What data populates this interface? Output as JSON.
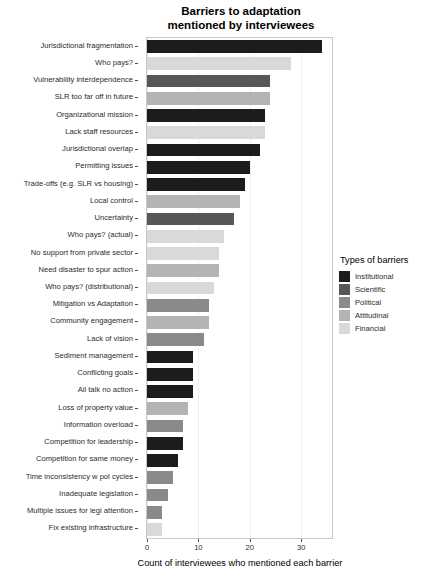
{
  "chart_data": {
    "type": "bar",
    "orientation": "horizontal",
    "title": "Barriers to adaptation\nmentioned by interviewees",
    "xlabel": "Count of interviewees who mentioned each barrier",
    "ylabel": "",
    "xlim": [
      0,
      36
    ],
    "xticks": [
      0,
      10,
      20,
      30
    ],
    "xtick_labels": [
      "0",
      "10",
      "20",
      "30"
    ],
    "grid": true,
    "legend": {
      "title": "Types of barriers",
      "position": "right",
      "entries": [
        {
          "label": "Institutional",
          "color": "#1c1c1c"
        },
        {
          "label": "Scientific",
          "color": "#575757"
        },
        {
          "label": "Political",
          "color": "#8a8a8a"
        },
        {
          "label": "Attitudinal",
          "color": "#b4b4b4"
        },
        {
          "label": "Financial",
          "color": "#d9d9d9"
        }
      ]
    },
    "categories": [
      "Jurisdictional fragmentation",
      "Who pays?",
      "Vulnerability interdependence",
      "SLR too far off in future",
      "Organizational mission",
      "Lack staff resources",
      "Jurisdictional overlap",
      "Permitting issues",
      "Trade-offs (e.g. SLR vs housing)",
      "Local control",
      "Uncertainty",
      "Who pays? (actual)",
      "No support from private sector",
      "Need disaster to spur action",
      "Who pays? (distributional)",
      "Mitigation vs Adaptation",
      "Community engagement",
      "Lack of vision",
      "Sediment management",
      "Conflicting goals",
      "All talk no action",
      "Loss of property value",
      "Information overload",
      "Competition for leadership",
      "Competition for same money",
      "Time inconsistency w pol cycles",
      "Inadequate legislation",
      "Multiple issues for legi attention",
      "Fix existing infrastructure"
    ],
    "values": [
      34,
      28,
      24,
      24,
      23,
      23,
      22,
      20,
      19,
      18,
      17,
      15,
      14,
      14,
      13,
      12,
      12,
      11,
      9,
      9,
      9,
      8,
      7,
      7,
      6,
      5,
      4,
      3,
      3
    ],
    "value_types": [
      "Institutional",
      "Financial",
      "Scientific",
      "Attitudinal",
      "Institutional",
      "Financial",
      "Institutional",
      "Institutional",
      "Institutional",
      "Attitudinal",
      "Scientific",
      "Financial",
      "Financial",
      "Attitudinal",
      "Financial",
      "Political",
      "Attitudinal",
      "Political",
      "Institutional",
      "Institutional",
      "Institutional",
      "Attitudinal",
      "Political",
      "Institutional",
      "Institutional",
      "Political",
      "Political",
      "Political",
      "Financial"
    ]
  }
}
